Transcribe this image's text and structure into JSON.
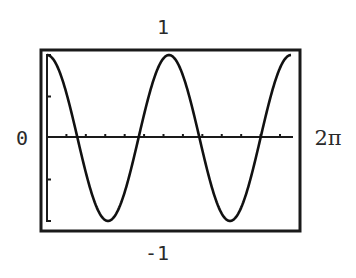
{
  "chart_data": {
    "type": "line",
    "title": "",
    "xlabel": "",
    "ylabel": "",
    "function": "y = cos(2x)",
    "xlim": [
      0,
      6.283185
    ],
    "ylim": [
      -1,
      1
    ],
    "x_tick_step": 0.5,
    "y_tick_step": 0.5,
    "grid": false,
    "legend": null,
    "labels": {
      "ymax": "1",
      "ymin": "-1",
      "xmin": "0",
      "xmax": "2π"
    },
    "series": [
      {
        "name": "cos(2x)",
        "x": [
          0,
          0.785398,
          1.570796,
          2.356194,
          3.141593,
          3.926991,
          4.712389,
          5.497787,
          6.283185
        ],
        "values": [
          1,
          0,
          -1,
          0,
          1,
          0,
          -1,
          0,
          1
        ]
      }
    ]
  },
  "colors": {
    "line": "#111111",
    "frame": "#1a1a1a",
    "background": "#ffffff"
  }
}
